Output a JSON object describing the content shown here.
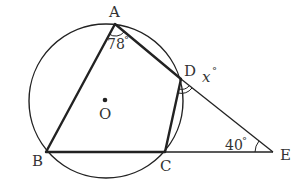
{
  "diagram": {
    "type": "circle-geometry",
    "circle": {
      "center_label": "O",
      "cx": 106,
      "cy": 101,
      "r": 77
    },
    "points": {
      "A": {
        "label": "A",
        "x": 115,
        "y": 24
      },
      "B": {
        "label": "B",
        "x": 46,
        "y": 152
      },
      "C": {
        "label": "C",
        "x": 165,
        "y": 152
      },
      "D": {
        "label": "D",
        "x": 181,
        "y": 79
      },
      "E": {
        "label": "E",
        "x": 273,
        "y": 152
      },
      "O": {
        "label": "O",
        "x": 105,
        "y": 100
      }
    },
    "angles": {
      "A": {
        "value": "78",
        "unit": "°"
      },
      "E": {
        "value": "40",
        "unit": "°"
      },
      "D_exterior": {
        "value": "x",
        "unit": "°"
      }
    },
    "colors": {
      "stroke": "#222222",
      "text": "#333333",
      "background": "#ffffff"
    }
  }
}
